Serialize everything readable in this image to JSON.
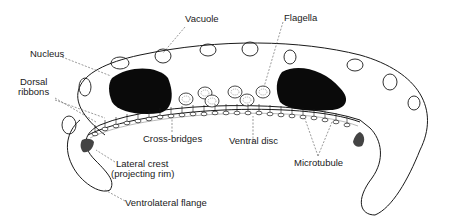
{
  "diagram": {
    "colors": {
      "ink": "#1a1a1a",
      "background": "#ffffff",
      "leader": "#555555"
    },
    "labels": {
      "vacuole": "Vacuole",
      "flagella": "Flagella",
      "nucleus": "Nucleus",
      "dorsal_ribbons_1": "Dorsal",
      "dorsal_ribbons_2": "ribbons",
      "cross_bridges": "Cross-bridges",
      "ventral_disc": "Ventral disc",
      "microtubule": "Microtubule",
      "lateral_crest_1": "Lateral crest",
      "lateral_crest_2": "(projecting rim)",
      "ventrolateral_flange": "Ventrolateral flange"
    }
  }
}
